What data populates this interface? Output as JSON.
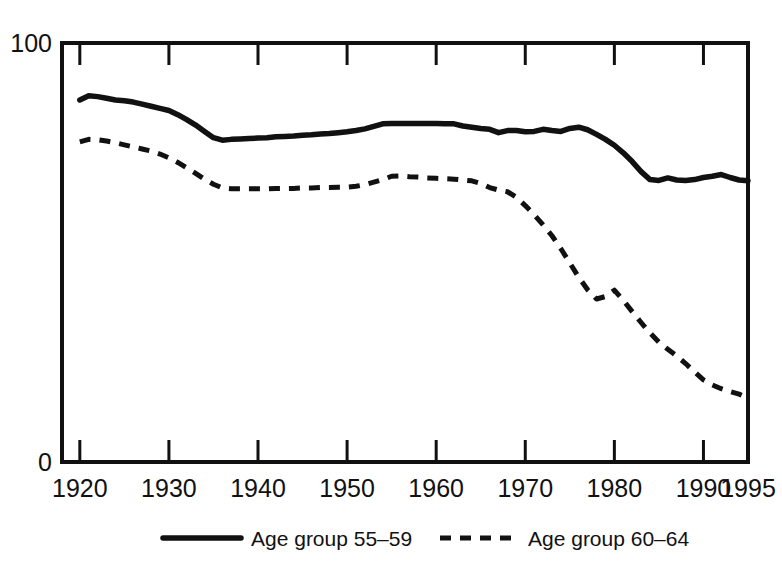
{
  "chart_data": {
    "type": "line",
    "title": "",
    "subtitle": "",
    "xlabel": "",
    "ylabel": "",
    "xlim": [
      1918,
      1995
    ],
    "ylim": [
      0,
      100
    ],
    "grid": false,
    "legend_position": "bottom",
    "y_ticklabels": [
      "100",
      "0"
    ],
    "y_tickvalues": [
      100,
      0
    ],
    "x_ticklabels": [
      "1920",
      "1930",
      "1940",
      "1950",
      "1960",
      "1970",
      "1980",
      "1990",
      "1995"
    ],
    "x_tickvalues": [
      1920,
      1930,
      1940,
      1950,
      1960,
      1970,
      1980,
      1990,
      1995
    ],
    "x": [
      1920,
      1921,
      1922,
      1923,
      1924,
      1925,
      1926,
      1927,
      1928,
      1929,
      1930,
      1931,
      1932,
      1933,
      1934,
      1935,
      1936,
      1937,
      1938,
      1939,
      1940,
      1941,
      1942,
      1943,
      1944,
      1945,
      1946,
      1947,
      1948,
      1949,
      1950,
      1951,
      1952,
      1953,
      1954,
      1955,
      1956,
      1957,
      1958,
      1959,
      1960,
      1961,
      1962,
      1963,
      1964,
      1965,
      1966,
      1967,
      1968,
      1969,
      1970,
      1971,
      1972,
      1973,
      1974,
      1975,
      1976,
      1977,
      1978,
      1979,
      1980,
      1981,
      1982,
      1983,
      1984,
      1985,
      1986,
      1987,
      1988,
      1989,
      1990,
      1991,
      1992,
      1993,
      1994,
      1995
    ],
    "series": [
      {
        "name": "Age group 55–59",
        "style": "solid",
        "values": [
          86.4,
          87.4,
          87.2,
          86.8,
          86.4,
          86.2,
          85.9,
          85.4,
          84.9,
          84.4,
          83.9,
          82.9,
          81.7,
          80.4,
          78.9,
          77.4,
          76.8,
          77.0,
          77.1,
          77.2,
          77.3,
          77.4,
          77.6,
          77.7,
          77.8,
          78.0,
          78.1,
          78.3,
          78.4,
          78.6,
          78.8,
          79.1,
          79.5,
          80.1,
          80.7,
          80.8,
          80.8,
          80.8,
          80.8,
          80.8,
          80.8,
          80.7,
          80.7,
          80.2,
          79.9,
          79.6,
          79.4,
          78.6,
          79.1,
          79.1,
          78.8,
          78.9,
          79.4,
          79.1,
          78.9,
          79.6,
          79.9,
          79.3,
          78.2,
          77.0,
          75.6,
          73.8,
          71.7,
          69.3,
          67.4,
          67.2,
          67.8,
          67.3,
          67.2,
          67.4,
          67.9,
          68.2,
          68.6,
          67.9,
          67.3,
          67.1
        ]
      },
      {
        "name": "Age group 60–64",
        "style": "dashed",
        "values": [
          76.4,
          77.0,
          76.9,
          76.6,
          76.2,
          75.7,
          75.2,
          74.7,
          74.2,
          73.5,
          72.6,
          71.5,
          70.2,
          68.9,
          67.5,
          66.3,
          65.4,
          65.2,
          65.2,
          65.2,
          65.2,
          65.2,
          65.3,
          65.3,
          65.3,
          65.4,
          65.4,
          65.5,
          65.5,
          65.6,
          65.6,
          65.8,
          66.2,
          66.8,
          67.4,
          68.2,
          68.3,
          68.1,
          68.0,
          67.8,
          67.7,
          67.6,
          67.5,
          67.3,
          67.1,
          66.5,
          65.5,
          64.9,
          64.5,
          63.2,
          61.2,
          59.0,
          56.6,
          54.0,
          50.9,
          47.5,
          44.1,
          41.1,
          38.9,
          39.5,
          41.0,
          38.6,
          35.9,
          33.3,
          30.8,
          28.6,
          26.9,
          25.3,
          23.5,
          21.5,
          19.6,
          18.4,
          17.5,
          16.8,
          16.2,
          15.3
        ]
      }
    ]
  },
  "legend": {
    "items": [
      {
        "label": "Age group 55–59",
        "style": "solid"
      },
      {
        "label": "Age group 60–64",
        "style": "dashed"
      }
    ]
  },
  "colors": {
    "ink": "#111111",
    "background": "#ffffff"
  }
}
